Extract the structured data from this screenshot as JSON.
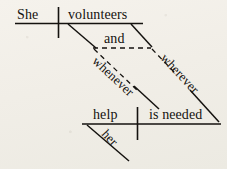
{
  "diagram": {
    "type": "reed-kellogg-sentence-diagram",
    "sentence": "She volunteers wherever and whenever help is needed.",
    "ink_color": "#14120f",
    "paper_color": "#f2efe9",
    "words": {
      "subject": "She",
      "predicate": "volunteers",
      "conjunction": "and",
      "subordinator_left": "whenever",
      "subordinator_right": "wherever",
      "dependent_subject": "help",
      "dependent_predicate": "is needed",
      "modifier": "her"
    }
  }
}
